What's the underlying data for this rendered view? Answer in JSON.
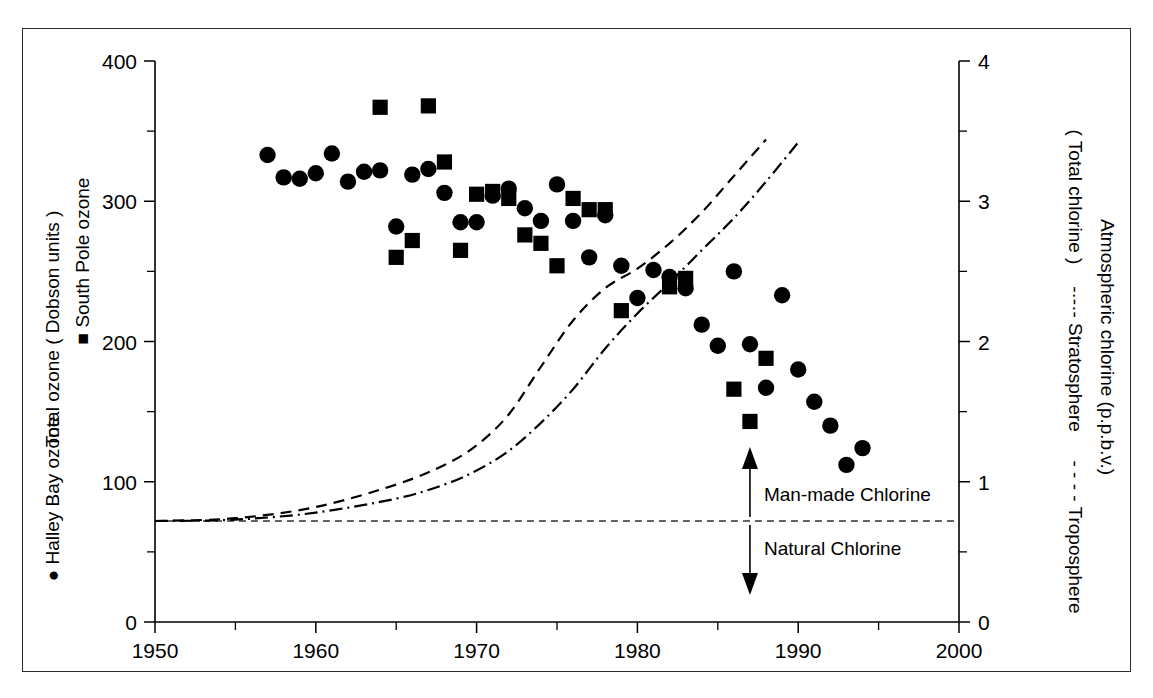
{
  "figure": {
    "left_axis": {
      "title": "Total ozone ( Dobson units )",
      "legend_square": "■ South Pole ozone",
      "legend_circle": "● Halley Bay ozone",
      "min": 0,
      "max": 400,
      "major_ticks": [
        0,
        100,
        200,
        300,
        400
      ],
      "minor_ticks": [
        50,
        150,
        250,
        350
      ],
      "tick_labels": [
        "0",
        "100",
        "200",
        "300",
        "400"
      ]
    },
    "right_axis": {
      "title": "Atmospheric chlorine (p.p.b.v.)",
      "subtitle": "( Total chlorine )",
      "legend_strato": "-·-·-  Stratosphere",
      "legend_tropo": "- - - -  Troposphere",
      "min": 0,
      "max": 4,
      "major_ticks": [
        0,
        1,
        2,
        3,
        4
      ],
      "minor_ticks": [
        0.5,
        1.5,
        2.5,
        3.5
      ],
      "tick_labels": [
        "0",
        "1",
        "2",
        "3",
        "4"
      ]
    },
    "x_axis": {
      "min": 1950,
      "max": 2000,
      "major_ticks": [
        1950,
        1960,
        1970,
        1980,
        1990,
        2000
      ],
      "minor_ticks": [
        1955,
        1965,
        1975,
        1985,
        1995
      ],
      "tick_labels": [
        "1950",
        "1960",
        "1970",
        "1980",
        "1990",
        "2000"
      ]
    },
    "annotations": {
      "man_made": "Man-made Chlorine",
      "natural": "Natural Chlorine",
      "natural_level_ppbv": 0.72,
      "arrow_year": 1987
    },
    "colors": {
      "ink": "#000000",
      "frame": "#2a2a2a",
      "background": "#ffffff"
    }
  },
  "chart_data": {
    "type": "scatter",
    "title": "",
    "xlabel": "",
    "ylabel": "Total ozone ( Dobson units )",
    "y2label": "Atmospheric chlorine (p.p.b.v.)",
    "xlim": [
      1950,
      2000
    ],
    "ylim": [
      0,
      400
    ],
    "y2lim": [
      0,
      4
    ],
    "grid": false,
    "legend_position": "axis-labels",
    "series": [
      {
        "name": "Halley Bay ozone",
        "marker": "circle",
        "axis": "left",
        "units": "Dobson units",
        "x": [
          1957,
          1958,
          1959,
          1960,
          1961,
          1962,
          1963,
          1964,
          1965,
          1966,
          1967,
          1968,
          1969,
          1970,
          1971,
          1972,
          1973,
          1974,
          1975,
          1976,
          1977,
          1978,
          1979,
          1980,
          1981,
          1982,
          1983,
          1984,
          1985,
          1986,
          1987,
          1988,
          1989,
          1990,
          1991,
          1992,
          1993,
          1994
        ],
        "y": [
          333,
          317,
          316,
          320,
          334,
          314,
          321,
          322,
          282,
          319,
          323,
          306,
          285,
          285,
          304,
          309,
          295,
          286,
          312,
          286,
          260,
          290,
          254,
          231,
          251,
          246,
          238,
          212,
          197,
          250,
          198,
          167,
          233,
          180,
          157,
          140,
          112,
          124
        ]
      },
      {
        "name": "South Pole ozone",
        "marker": "square",
        "axis": "left",
        "units": "Dobson units",
        "x": [
          1964,
          1965,
          1966,
          1967,
          1968,
          1969,
          1970,
          1971,
          1972,
          1973,
          1974,
          1975,
          1976,
          1977,
          1978,
          1979,
          1982,
          1983,
          1986,
          1987,
          1988
        ],
        "y": [
          367,
          260,
          272,
          368,
          328,
          265,
          305,
          307,
          302,
          276,
          270,
          254,
          302,
          294,
          294,
          222,
          239,
          245,
          166,
          143,
          188
        ]
      },
      {
        "name": "Troposphere",
        "marker": "none",
        "line": "dashed",
        "axis": "right",
        "units": "p.p.b.v.",
        "x": [
          1950,
          1955,
          1960,
          1965,
          1968,
          1970,
          1972,
          1974,
          1976,
          1978,
          1980,
          1982,
          1984,
          1986,
          1988
        ],
        "y": [
          0.72,
          0.74,
          0.82,
          0.98,
          1.12,
          1.26,
          1.48,
          1.82,
          2.15,
          2.38,
          2.52,
          2.7,
          2.92,
          3.18,
          3.44
        ]
      },
      {
        "name": "Stratosphere",
        "marker": "none",
        "line": "dash-dot",
        "axis": "right",
        "units": "p.p.b.v.",
        "x": [
          1950,
          1955,
          1960,
          1965,
          1968,
          1970,
          1972,
          1974,
          1976,
          1978,
          1980,
          1982,
          1984,
          1986,
          1988,
          1990
        ],
        "y": [
          0.72,
          0.73,
          0.78,
          0.88,
          0.98,
          1.08,
          1.22,
          1.42,
          1.66,
          1.95,
          2.2,
          2.42,
          2.65,
          2.88,
          3.14,
          3.42
        ]
      }
    ],
    "reference_lines": [
      {
        "name": "Natural chlorine baseline",
        "axis": "right",
        "value": 0.72,
        "style": "dashed"
      }
    ],
    "annotations": [
      {
        "text": "Man-made Chlorine",
        "x": 1987,
        "direction": "up"
      },
      {
        "text": "Natural Chlorine",
        "x": 1987,
        "direction": "down"
      }
    ]
  }
}
